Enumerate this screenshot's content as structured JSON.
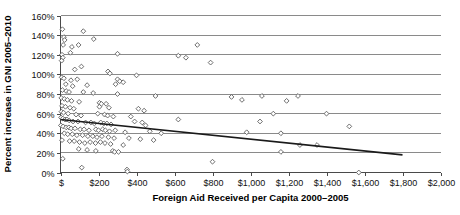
{
  "chart_data": {
    "type": "scatter",
    "title": "",
    "xlabel": "Foreign Aid Received per Capita 2000–2005",
    "ylabel": "Percent increase in GNI 2005–2010",
    "xlim": [
      0,
      2000
    ],
    "ylim": [
      0,
      160
    ],
    "grid": true,
    "legend": "none",
    "xticks": [
      0,
      200,
      400,
      600,
      800,
      1000,
      1200,
      1400,
      1600,
      1800,
      2000
    ],
    "xticklabels": [
      "$",
      "$200",
      "$400",
      "$600",
      "$800",
      "$1,000",
      "$1,200",
      "$1,400",
      "$1,600",
      "$1,800",
      "$2,000"
    ],
    "yticks": [
      0,
      20,
      40,
      60,
      80,
      100,
      120,
      140,
      160
    ],
    "yticklabels": [
      "0%",
      "20%",
      "40%",
      "60%",
      "80%",
      "100%",
      "120%",
      "140%",
      "160%"
    ],
    "marker": "open-diamond",
    "marker_color": "#5d5d5d",
    "gridline_color": "#8a8a8a",
    "trendline": {
      "type": "linear",
      "color": "#1a1a1a",
      "x_start": 0,
      "y_start": 54,
      "x_end": 1800,
      "y_end": 18
    },
    "series": [
      {
        "name": "Countries",
        "points": [
          [
            10,
            146
          ],
          [
            18,
            138
          ],
          [
            22,
            135
          ],
          [
            14,
            130
          ],
          [
            120,
            144
          ],
          [
            175,
            136
          ],
          [
            95,
            130
          ],
          [
            60,
            128
          ],
          [
            52,
            122
          ],
          [
            8,
            120
          ],
          [
            12,
            117
          ],
          [
            6,
            114
          ],
          [
            300,
            121
          ],
          [
            720,
            130
          ],
          [
            620,
            119
          ],
          [
            660,
            117
          ],
          [
            790,
            112
          ],
          [
            110,
            108
          ],
          [
            75,
            105
          ],
          [
            250,
            103
          ],
          [
            260,
            101
          ],
          [
            6,
            97
          ],
          [
            18,
            96
          ],
          [
            88,
            95
          ],
          [
            55,
            94
          ],
          [
            400,
            99
          ],
          [
            300,
            95
          ],
          [
            312,
            93
          ],
          [
            330,
            92
          ],
          [
            28,
            90
          ],
          [
            140,
            89
          ],
          [
            64,
            88
          ],
          [
            290,
            90
          ],
          [
            10,
            84
          ],
          [
            30,
            83
          ],
          [
            45,
            82
          ],
          [
            120,
            82
          ],
          [
            172,
            81
          ],
          [
            300,
            80
          ],
          [
            500,
            78
          ],
          [
            900,
            77
          ],
          [
            1060,
            78
          ],
          [
            1250,
            78
          ],
          [
            4,
            76
          ],
          [
            20,
            75
          ],
          [
            36,
            74
          ],
          [
            58,
            73
          ],
          [
            98,
            72
          ],
          [
            205,
            71
          ],
          [
            215,
            70
          ],
          [
            240,
            70
          ],
          [
            955,
            74
          ],
          [
            1190,
            73
          ],
          [
            8,
            68
          ],
          [
            26,
            67
          ],
          [
            50,
            66
          ],
          [
            70,
            65
          ],
          [
            205,
            67
          ],
          [
            255,
            66
          ],
          [
            410,
            65
          ],
          [
            440,
            63
          ],
          [
            1400,
            60
          ],
          [
            1120,
            60
          ],
          [
            5,
            62
          ],
          [
            16,
            61
          ],
          [
            40,
            60
          ],
          [
            82,
            59
          ],
          [
            108,
            58
          ],
          [
            196,
            60
          ],
          [
            232,
            59
          ],
          [
            248,
            58
          ],
          [
            278,
            57
          ],
          [
            370,
            57
          ],
          [
            3,
            56
          ],
          [
            12,
            55
          ],
          [
            24,
            54
          ],
          [
            34,
            54
          ],
          [
            46,
            53
          ],
          [
            66,
            52
          ],
          [
            92,
            52
          ],
          [
            132,
            51
          ],
          [
            160,
            51
          ],
          [
            178,
            50
          ],
          [
            212,
            51
          ],
          [
            228,
            50
          ],
          [
            244,
            50
          ],
          [
            266,
            49
          ],
          [
            390,
            52
          ],
          [
            430,
            51
          ],
          [
            448,
            48
          ],
          [
            620,
            54
          ],
          [
            1050,
            52
          ],
          [
            1520,
            47
          ],
          [
            2,
            48
          ],
          [
            14,
            47
          ],
          [
            30,
            46
          ],
          [
            44,
            46
          ],
          [
            56,
            45
          ],
          [
            76,
            45
          ],
          [
            104,
            44
          ],
          [
            124,
            44
          ],
          [
            150,
            43
          ],
          [
            186,
            44
          ],
          [
            200,
            43
          ],
          [
            222,
            44
          ],
          [
            236,
            43
          ],
          [
            258,
            42
          ],
          [
            288,
            43
          ],
          [
            340,
            41
          ],
          [
            470,
            42
          ],
          [
            530,
            40
          ],
          [
            980,
            41
          ],
          [
            1160,
            40
          ],
          [
            20,
            40
          ],
          [
            38,
            39
          ],
          [
            62,
            39
          ],
          [
            86,
            38
          ],
          [
            116,
            38
          ],
          [
            144,
            37
          ],
          [
            170,
            37
          ],
          [
            192,
            36
          ],
          [
            218,
            37
          ],
          [
            252,
            36
          ],
          [
            282,
            35
          ],
          [
            360,
            35
          ],
          [
            420,
            34
          ],
          [
            490,
            33
          ],
          [
            8,
            33
          ],
          [
            48,
            32
          ],
          [
            72,
            32
          ],
          [
            100,
            31
          ],
          [
            128,
            30
          ],
          [
            156,
            31
          ],
          [
            184,
            30
          ],
          [
            210,
            31
          ],
          [
            234,
            30
          ],
          [
            264,
            29
          ],
          [
            330,
            28
          ],
          [
            1260,
            28
          ],
          [
            1350,
            28
          ],
          [
            96,
            24
          ],
          [
            140,
            23
          ],
          [
            186,
            22
          ],
          [
            275,
            22
          ],
          [
            285,
            21
          ],
          [
            305,
            21
          ],
          [
            1160,
            21
          ],
          [
            12,
            14
          ],
          [
            800,
            11
          ],
          [
            112,
            5
          ],
          [
            350,
            3
          ],
          [
            352,
            1
          ],
          [
            1570,
            0
          ]
        ]
      }
    ]
  }
}
